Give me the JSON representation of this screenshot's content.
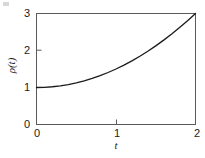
{
  "chart_data": {
    "type": "line",
    "title": "",
    "subtitle": "",
    "xlabel": "t",
    "ylabel": "ρ(t)",
    "xlim": [
      0,
      2
    ],
    "ylim": [
      0,
      3
    ],
    "xticks": [
      0,
      1,
      2
    ],
    "xtick_labels": [
      "0",
      "1",
      "2"
    ],
    "yticks": [
      0,
      1,
      2,
      3
    ],
    "ytick_labels": [
      "0",
      "1",
      "2",
      "3"
    ],
    "grid": false,
    "legend": null,
    "series": [
      {
        "name": "ρ(t)",
        "color": "#1a1a1a",
        "linewidth": 1.2,
        "x": [
          0,
          0.1,
          0.2,
          0.3,
          0.4,
          0.5,
          0.6,
          0.7,
          0.8,
          0.9,
          1.0,
          1.1,
          1.2,
          1.3,
          1.4,
          1.5,
          1.6,
          1.7,
          1.8,
          1.9,
          2.0
        ],
        "values": [
          1.0,
          1.005,
          1.02,
          1.045,
          1.08,
          1.125,
          1.18,
          1.245,
          1.32,
          1.405,
          1.5,
          1.605,
          1.72,
          1.845,
          1.98,
          2.125,
          2.28,
          2.445,
          2.62,
          2.805,
          3.0
        ]
      }
    ],
    "annotations": []
  },
  "axes": {
    "x_tick_0": "0",
    "x_tick_1": "1",
    "x_tick_2": "2",
    "y_tick_0": "0",
    "y_tick_1": "1",
    "y_tick_2": "2",
    "y_tick_3": "3",
    "x_axis_title": "t",
    "y_axis_title": "ρ(t)"
  },
  "style": {
    "frame_color": "#5a5a5a",
    "curve_color": "#1a1a1a",
    "text_color": "#1a1a1a",
    "background": "#ffffff"
  }
}
